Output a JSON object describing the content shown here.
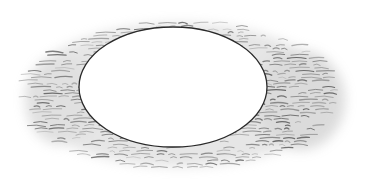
{
  "illustration": {
    "subject": "hand-drawn oval hole with sketchy hatched shading",
    "background_color": "#ffffff",
    "shading_color": "#8a8a8a",
    "outline_color": "#2a2a2a",
    "oval": {
      "cx": 173,
      "cy": 87,
      "rx": 94,
      "ry": 60
    }
  }
}
